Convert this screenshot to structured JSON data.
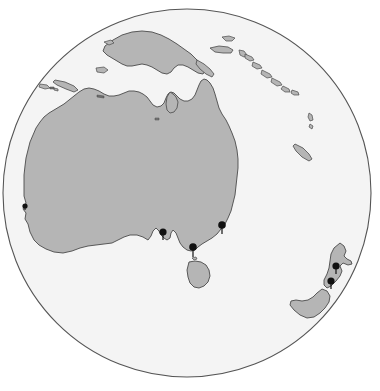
{
  "map": {
    "title": "Orthographic globe projection centred on Australia and Oceania",
    "projection": "orthographic",
    "region_label": "Australia / Oceania",
    "background_color": "#ffffff",
    "ocean_color": "#f4f4f4",
    "land_color": "#b5b5b5",
    "land_stroke_color": "#4a4a4a",
    "globe_outline_color": "#555555",
    "marker_color": "#111111",
    "globe": {
      "center_x": 187,
      "center_y": 193,
      "radius": 184
    },
    "markers": [
      {
        "id": "marker-perth",
        "label": "Perth",
        "x": 25,
        "y": 207,
        "r": 2.6,
        "tail": 3
      },
      {
        "id": "marker-adelaide",
        "label": "Adelaide",
        "x": 163,
        "y": 233,
        "r": 3.6,
        "tail": 7
      },
      {
        "id": "marker-melbourne",
        "label": "Melbourne",
        "x": 193,
        "y": 248,
        "r": 3.8,
        "tail": 9
      },
      {
        "id": "marker-sydney",
        "label": "Sydney",
        "x": 222,
        "y": 226,
        "r": 3.8,
        "tail": 8
      },
      {
        "id": "marker-auckland",
        "label": "Auckland",
        "x": 336,
        "y": 267,
        "r": 3.6,
        "tail": 7
      },
      {
        "id": "marker-wellington",
        "label": "Wellington",
        "x": 331,
        "y": 282,
        "r": 3.6,
        "tail": 7
      }
    ],
    "landmasses": [
      {
        "id": "land-australia",
        "label": "Australia"
      },
      {
        "id": "land-tasmania",
        "label": "Tasmania"
      },
      {
        "id": "land-new-guinea",
        "label": "New Guinea"
      },
      {
        "id": "land-new-zealand-north",
        "label": "New Zealand North Island"
      },
      {
        "id": "land-new-zealand-south",
        "label": "New Zealand South Island"
      },
      {
        "id": "land-timor",
        "label": "Timor"
      },
      {
        "id": "land-indonesia-islands",
        "label": "Lesser Sunda Islands"
      },
      {
        "id": "land-solomon-islands",
        "label": "Solomon Islands"
      },
      {
        "id": "land-new-britain",
        "label": "New Britain"
      },
      {
        "id": "land-new-caledonia",
        "label": "New Caledonia"
      },
      {
        "id": "land-vanuatu",
        "label": "Vanuatu"
      }
    ]
  }
}
